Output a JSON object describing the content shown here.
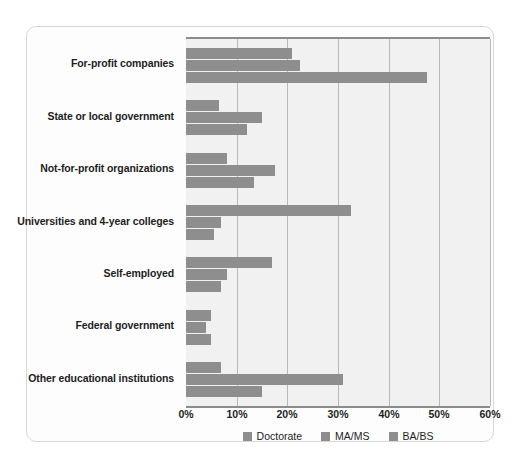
{
  "chart_data": {
    "type": "bar",
    "orientation": "horizontal",
    "title": "",
    "subtitle": "",
    "xlabel": "",
    "ylabel": "",
    "xlim": [
      0,
      60
    ],
    "xunit": "%",
    "xticks": [
      "0%",
      "10%",
      "20%",
      "30%",
      "40%",
      "50%",
      "60%"
    ],
    "xtick_values": [
      0,
      10,
      20,
      30,
      40,
      50,
      60
    ],
    "grid": true,
    "legend_position": "bottom",
    "categories": [
      "For-profit companies",
      "State or local government",
      "Not-for-profit organizations",
      "Universities and 4-year colleges",
      "Self-employed",
      "Federal government",
      "Other educational institutions"
    ],
    "series": [
      {
        "name": "Doctorate",
        "color": "#8e8e8e",
        "values": [
          21.0,
          6.5,
          8.0,
          32.5,
          17.0,
          5.0,
          7.0
        ]
      },
      {
        "name": "MA/MS",
        "color": "#8e8e8e",
        "values": [
          22.5,
          15.0,
          17.5,
          7.0,
          8.0,
          4.0,
          31.0
        ]
      },
      {
        "name": "BA/BS",
        "color": "#8e8e8e",
        "values": [
          47.5,
          12.0,
          13.5,
          5.5,
          7.0,
          5.0,
          15.0
        ]
      }
    ]
  },
  "style": {
    "plot_background": "#f1f1f1",
    "gridline_color": "#b9b9b9",
    "axis_color": "#8c8c8c",
    "card_border": "#d8d8d8",
    "page_background": "#ffffff",
    "text_color": "#1d1d1d"
  }
}
